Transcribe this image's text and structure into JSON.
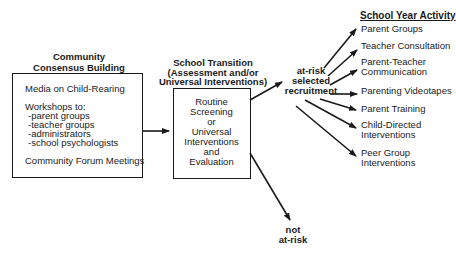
{
  "community": {
    "title_line1": "Community",
    "title_line2": "Consensus Building",
    "media": "Media on Child-Rearing",
    "workshops_heading": "Workshops to:",
    "workshops": [
      "-parent groups",
      "-teacher groups",
      "-administrators",
      "-school psychologists"
    ],
    "forum": "Community Forum Meetings"
  },
  "transition": {
    "title_line1": "School Transition",
    "title_line2": "(Assessment and/or",
    "title_line3": "Universal Interventions)",
    "box_lines": [
      "Routine",
      "Screening",
      "or",
      "Universal",
      "Interventions",
      "and",
      "Evaluation"
    ]
  },
  "at_risk": {
    "lines": [
      "at-risk",
      "selected",
      "recruitment"
    ]
  },
  "not_at_risk": {
    "lines": [
      "not",
      "at-risk"
    ]
  },
  "school_year": {
    "heading": "School Year Activity",
    "items": [
      {
        "line1": "Parent Groups",
        "line2": ""
      },
      {
        "line1": "Teacher Consultation",
        "line2": ""
      },
      {
        "line1": "Parent-Teacher",
        "line2": "Communication"
      },
      {
        "line1": "Parenting Videotapes",
        "line2": ""
      },
      {
        "line1": "Parent Training",
        "line2": ""
      },
      {
        "line1": "Child-Directed",
        "line2": "Interventions"
      },
      {
        "line1": "Peer Group",
        "line2": "Interventions"
      }
    ]
  },
  "colors": {
    "ink": "#1a1a1a",
    "background": "#ffffff"
  }
}
